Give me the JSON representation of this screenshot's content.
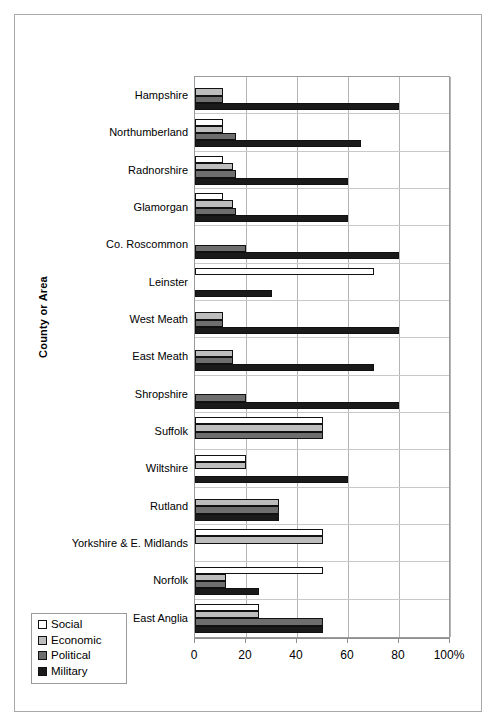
{
  "chart_data": {
    "type": "bar",
    "orientation": "horizontal",
    "title": "",
    "xlabel": "",
    "ylabel": "County or Area",
    "xlim": [
      0,
      100
    ],
    "xunit": "%",
    "grid": true,
    "legend_position": "bottom-left",
    "xticks": [
      {
        "value": 0,
        "label": "0"
      },
      {
        "value": 20,
        "label": "20"
      },
      {
        "value": 40,
        "label": "40"
      },
      {
        "value": 60,
        "label": "60"
      },
      {
        "value": 80,
        "label": "80"
      },
      {
        "value": 100,
        "label": "100%"
      }
    ],
    "categories": [
      "Hampshire",
      "Northumberland",
      "Radnorshire",
      "Glamorgan",
      "Co. Roscommon",
      "Leinster",
      "West Meath",
      "East Meath",
      "Shropshire",
      "Suffolk",
      "Wiltshire",
      "Rutland",
      "Yorkshire & E. Midlands",
      "Norfolk",
      "East Anglia"
    ],
    "series": [
      {
        "name": "Social",
        "color": "#ffffff",
        "values": [
          0,
          11,
          11,
          11,
          0,
          70,
          0,
          0,
          0,
          50,
          20,
          0,
          50,
          50,
          25
        ]
      },
      {
        "name": "Economic",
        "color": "#bdbdbd",
        "values": [
          11,
          11,
          15,
          15,
          0,
          0,
          11,
          15,
          0,
          50,
          20,
          33,
          50,
          12,
          25
        ]
      },
      {
        "name": "Political",
        "color": "#6e6e6e",
        "values": [
          11,
          16,
          16,
          16,
          20,
          0,
          11,
          15,
          20,
          50,
          0,
          33,
          0,
          12,
          50
        ]
      },
      {
        "name": "Military",
        "color": "#1a1a1a",
        "values": [
          80,
          65,
          60,
          60,
          80,
          30,
          80,
          70,
          80,
          0,
          60,
          33,
          0,
          25,
          50
        ]
      }
    ]
  },
  "legend": {
    "items": [
      {
        "label": "Social",
        "key": "social"
      },
      {
        "label": "Economic",
        "key": "economic"
      },
      {
        "label": "Political",
        "key": "political"
      },
      {
        "label": "Military",
        "key": "military"
      }
    ]
  }
}
